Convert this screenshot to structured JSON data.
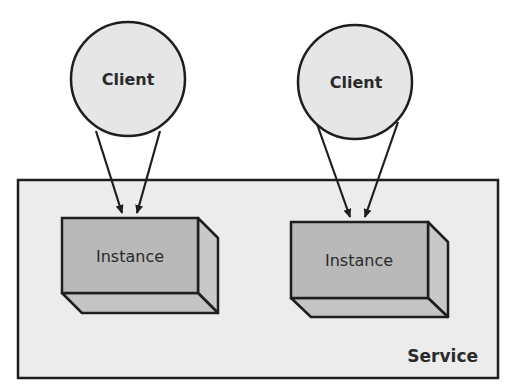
{
  "diagram": {
    "type": "architecture",
    "colors": {
      "background": "#ffffff",
      "service_fill": "#ececec",
      "client_fill": "#e6e6e6",
      "instance_front": "#b9b9b9",
      "instance_side": "#c8c8c8",
      "stroke": "#1e1e1e"
    },
    "service": {
      "label": "Service"
    },
    "clients": [
      {
        "label": "Client"
      },
      {
        "label": "Client"
      }
    ],
    "instances": [
      {
        "label": "Instance"
      },
      {
        "label": "Instance"
      }
    ],
    "connections": [
      {
        "from": "Client 1",
        "to": "Instance 1",
        "count": 2
      },
      {
        "from": "Client 2",
        "to": "Instance 2",
        "count": 2
      }
    ]
  }
}
